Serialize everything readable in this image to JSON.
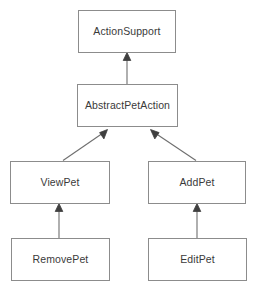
{
  "diagram": {
    "type": "uml-class-inheritance",
    "title": "",
    "background_color": "#ffffff",
    "box_fill_color": "#ffffff",
    "box_border_color": "#8c8c8c",
    "text_color": "#3a3a3a",
    "edge_color": "#6e6e6e",
    "classes": [
      {
        "id": "action-support",
        "name": "ActionSupport",
        "x": 78,
        "y": 10,
        "width": 98,
        "height": 43
      },
      {
        "id": "abstract-pet-action",
        "name": "AbstractPetAction",
        "x": 77,
        "y": 84,
        "width": 101,
        "height": 43
      },
      {
        "id": "view-pet",
        "name": "ViewPet",
        "x": 10,
        "y": 161,
        "width": 100,
        "height": 43
      },
      {
        "id": "add-pet",
        "name": "AddPet",
        "x": 148,
        "y": 161,
        "width": 98,
        "height": 43
      },
      {
        "id": "remove-pet",
        "name": "RemovePet",
        "x": 11,
        "y": 238,
        "width": 99,
        "height": 43
      },
      {
        "id": "edit-pet",
        "name": "EditPet",
        "x": 148,
        "y": 238,
        "width": 99,
        "height": 43
      }
    ],
    "relations": [
      {
        "id": "abstract-to-actionsupport",
        "kind": "generalization",
        "from": "abstract-pet-action",
        "to": "action-support",
        "label": ""
      },
      {
        "id": "viewpet-to-abstract",
        "kind": "generalization",
        "from": "view-pet",
        "to": "abstract-pet-action",
        "label": ""
      },
      {
        "id": "addpet-to-abstract",
        "kind": "generalization",
        "from": "add-pet",
        "to": "abstract-pet-action",
        "label": ""
      },
      {
        "id": "removepet-to-viewpet",
        "kind": "generalization",
        "from": "remove-pet",
        "to": "view-pet",
        "label": ""
      },
      {
        "id": "editpet-to-addpet",
        "kind": "generalization",
        "from": "edit-pet",
        "to": "add-pet",
        "label": ""
      }
    ]
  }
}
